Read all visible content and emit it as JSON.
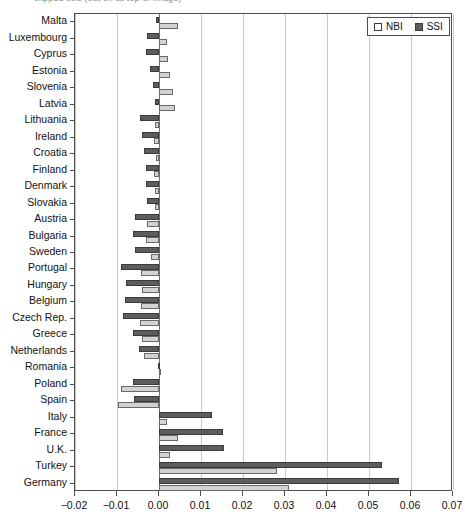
{
  "title": "clipped title (cut off at top of image)",
  "legend": {
    "position": "top-right",
    "entries": [
      {
        "label": "NBI",
        "swatch": "nbi",
        "color": "#ffffff"
      },
      {
        "label": "SSI",
        "swatch": "ssi",
        "color": "#5d5d5d"
      }
    ]
  },
  "axis": {
    "x_ticks": [
      "-0.02",
      "-0.01",
      "0.00",
      "0.01",
      "0.02",
      "0.03",
      "0.04",
      "0.05",
      "0.06",
      "0.07"
    ]
  },
  "chart_data": {
    "type": "bar",
    "orientation": "horizontal",
    "title": "",
    "xlabel": "",
    "ylabel": "",
    "xlim": [
      -0.02,
      0.07
    ],
    "grid": true,
    "legend_position": "top-right",
    "categories": [
      "Malta",
      "Luxembourg",
      "Cyprus",
      "Estonia",
      "Slovenia",
      "Latvia",
      "Lithuania",
      "Ireland",
      "Croatia",
      "Finland",
      "Denmark",
      "Slovakia",
      "Austria",
      "Bulgaria",
      "Sweden",
      "Portugal",
      "Hungary",
      "Belgium",
      "Czech Rep.",
      "Greece",
      "Netherlands",
      "Romania",
      "Poland",
      "Spain",
      "Italy",
      "France",
      "U.K.",
      "Turkey",
      "Germany"
    ],
    "series": [
      {
        "name": "SSI",
        "color": "#5d5d5d",
        "values": [
          -0.0008,
          -0.0028,
          -0.003,
          -0.0022,
          -0.0014,
          -0.001,
          -0.0045,
          -0.004,
          -0.0035,
          -0.0032,
          -0.003,
          -0.0028,
          -0.0058,
          -0.0062,
          -0.0057,
          -0.009,
          -0.0078,
          -0.008,
          -0.0085,
          -0.0062,
          -0.0048,
          -0.0002,
          -0.0062,
          -0.006,
          0.0125,
          0.0152,
          0.0155,
          0.053,
          0.0572
        ]
      },
      {
        "name": "NBI",
        "color": "#d2d2d2",
        "values": [
          0.0045,
          0.002,
          0.0022,
          0.0026,
          0.0033,
          0.0038,
          -0.001,
          -0.0012,
          -0.0008,
          -0.0012,
          -0.001,
          -0.001,
          -0.0028,
          -0.0032,
          -0.0018,
          -0.0042,
          -0.004,
          -0.0042,
          -0.0045,
          -0.004,
          -0.0035,
          0.0004,
          -0.009,
          -0.0098,
          0.002,
          0.0045,
          0.0025,
          0.028,
          0.031
        ]
      }
    ]
  }
}
